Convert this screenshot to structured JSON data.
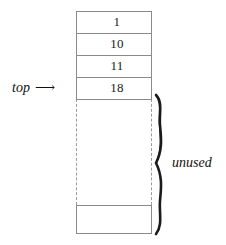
{
  "diagram": {
    "type": "stack-array",
    "title": "",
    "background_color": "#ffffff",
    "line_color": "#8a8a8a",
    "text_color": "#111111",
    "cells": [
      {
        "value": "1"
      },
      {
        "value": "10"
      },
      {
        "value": "11"
      },
      {
        "value": "18"
      }
    ],
    "pointer": {
      "label": "top",
      "arrow": "⟶"
    },
    "region": {
      "label": "unused",
      "brace": "right-curly-brace"
    }
  }
}
